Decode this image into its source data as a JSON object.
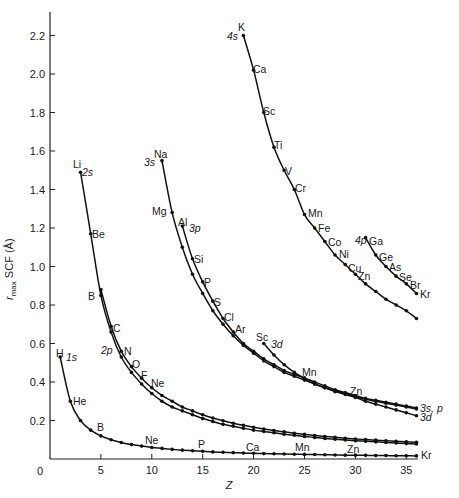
{
  "chart_data": {
    "type": "line",
    "title": "",
    "xlabel": "Z",
    "ylabel": "r_max SCF (Å)",
    "xlim": [
      0,
      37
    ],
    "ylim": [
      0,
      2.3
    ],
    "grid": false,
    "legend": "inline labels at curve ends",
    "x_ticks": [
      0,
      5,
      10,
      15,
      20,
      25,
      30,
      35
    ],
    "y_ticks": [
      0.2,
      0.4,
      0.6,
      0.8,
      1.0,
      1.2,
      1.4,
      1.6,
      1.8,
      2.0,
      2.2
    ],
    "y_tick_labels": [
      "0.2",
      "0.4",
      "0.6",
      "0.8",
      "1.0",
      "1.2",
      "1.4",
      "1.6",
      "1.8",
      "2.0",
      "2.2"
    ],
    "x_tick_labels": [
      "0",
      "5",
      "10",
      "15",
      "20",
      "25",
      "30",
      "35"
    ],
    "series": [
      {
        "name": "1s",
        "label_pos": "start",
        "x": [
          1,
          2,
          3,
          4,
          5,
          6,
          7,
          8,
          9,
          10,
          11,
          12,
          13,
          14,
          15,
          16,
          17,
          18,
          19,
          20,
          21,
          22,
          23,
          24,
          25,
          26,
          27,
          28,
          29,
          30,
          31,
          32,
          33,
          34,
          35,
          36
        ],
        "values": [
          0.53,
          0.3,
          0.2,
          0.15,
          0.12,
          0.1,
          0.086,
          0.075,
          0.067,
          0.06,
          0.055,
          0.05,
          0.046,
          0.043,
          0.04,
          0.037,
          0.035,
          0.033,
          0.031,
          0.03,
          0.028,
          0.027,
          0.026,
          0.025,
          0.024,
          0.023,
          0.022,
          0.021,
          0.02,
          0.02,
          0.019,
          0.018,
          0.018,
          0.017,
          0.017,
          0.016
        ]
      },
      {
        "name": "2s",
        "label_pos": "start",
        "x": [
          3,
          4,
          5,
          6,
          7,
          8,
          9,
          10,
          11,
          12,
          13,
          14,
          15,
          16,
          17,
          18,
          19,
          20,
          21,
          22,
          23,
          24,
          25,
          26,
          27,
          28,
          29,
          30,
          31,
          32,
          33,
          34,
          35,
          36
        ],
        "values": [
          1.49,
          1.17,
          0.85,
          0.66,
          0.53,
          0.45,
          0.39,
          0.34,
          0.3,
          0.27,
          0.25,
          0.23,
          0.21,
          0.195,
          0.18,
          0.17,
          0.16,
          0.15,
          0.143,
          0.136,
          0.129,
          0.123,
          0.117,
          0.112,
          0.107,
          0.103,
          0.099,
          0.095,
          0.092,
          0.089,
          0.086,
          0.083,
          0.08,
          0.078
        ]
      },
      {
        "name": "2p",
        "label_pos": "mid",
        "x": [
          5,
          6,
          7,
          8,
          9,
          10,
          11,
          12,
          13,
          14,
          15,
          16,
          17,
          18,
          19,
          20,
          21,
          22,
          23,
          24,
          25,
          26,
          27,
          28,
          29,
          30,
          31,
          32,
          33,
          34,
          35,
          36
        ],
        "values": [
          0.88,
          0.69,
          0.56,
          0.48,
          0.42,
          0.37,
          0.33,
          0.3,
          0.27,
          0.25,
          0.23,
          0.213,
          0.199,
          0.186,
          0.175,
          0.165,
          0.156,
          0.148,
          0.141,
          0.134,
          0.128,
          0.122,
          0.117,
          0.113,
          0.108,
          0.104,
          0.101,
          0.098,
          0.095,
          0.092,
          0.089,
          0.087
        ]
      },
      {
        "name": "3s",
        "label_pos": "start",
        "x": [
          11,
          12,
          13,
          14,
          15,
          16,
          17,
          18,
          19,
          20,
          21,
          22,
          23,
          24,
          25,
          26,
          27,
          28,
          29,
          30,
          31,
          32,
          33,
          34,
          35,
          36
        ],
        "values": [
          1.55,
          1.28,
          1.1,
          0.96,
          0.86,
          0.77,
          0.7,
          0.64,
          0.59,
          0.55,
          0.51,
          0.48,
          0.45,
          0.43,
          0.41,
          0.39,
          0.37,
          0.355,
          0.34,
          0.325,
          0.31,
          0.3,
          0.29,
          0.28,
          0.27,
          0.26
        ]
      },
      {
        "name": "3p",
        "label_pos": "start",
        "x": [
          13,
          14,
          15,
          16,
          17,
          18,
          19,
          20,
          21,
          22,
          23,
          24,
          25,
          26,
          27,
          28,
          29,
          30,
          31,
          32,
          33,
          34,
          35,
          36
        ],
        "values": [
          1.21,
          1.04,
          0.92,
          0.82,
          0.73,
          0.66,
          0.6,
          0.56,
          0.52,
          0.49,
          0.46,
          0.44,
          0.42,
          0.4,
          0.38,
          0.36,
          0.345,
          0.33,
          0.315,
          0.305,
          0.295,
          0.285,
          0.275,
          0.265
        ]
      },
      {
        "name": "3d",
        "label_pos": "start",
        "x": [
          21,
          22,
          23,
          24,
          25,
          26,
          27,
          28,
          29,
          30,
          31,
          32,
          33,
          34,
          35,
          36
        ],
        "values": [
          0.6,
          0.54,
          0.49,
          0.45,
          0.42,
          0.39,
          0.37,
          0.35,
          0.335,
          0.32,
          0.3,
          0.285,
          0.27,
          0.255,
          0.24,
          0.225
        ]
      },
      {
        "name": "4s",
        "label_pos": "start",
        "x": [
          19,
          20,
          21,
          22,
          23,
          24,
          25,
          26,
          27,
          28,
          29,
          30,
          31,
          32,
          33,
          34,
          35,
          36
        ],
        "values": [
          2.2,
          2.02,
          1.8,
          1.62,
          1.5,
          1.4,
          1.27,
          1.2,
          1.13,
          1.06,
          1.01,
          0.96,
          0.91,
          0.87,
          0.83,
          0.8,
          0.77,
          0.73
        ]
      },
      {
        "name": "4p",
        "label_pos": "start",
        "x": [
          31,
          32,
          33,
          34,
          35,
          36
        ],
        "values": [
          1.15,
          1.06,
          1.0,
          0.95,
          0.91,
          0.86
        ]
      }
    ],
    "element_labels": [
      {
        "text": "H",
        "z": 1,
        "series": "1s"
      },
      {
        "text": "He",
        "z": 2,
        "series": "1s"
      },
      {
        "text": "B",
        "z": 5,
        "series": "1s"
      },
      {
        "text": "Ne",
        "z": 10,
        "series": "1s"
      },
      {
        "text": "P",
        "z": 15,
        "series": "1s"
      },
      {
        "text": "Ca",
        "z": 20,
        "series": "1s"
      },
      {
        "text": "Mn",
        "z": 25,
        "series": "1s"
      },
      {
        "text": "Zn",
        "z": 30,
        "series": "1s"
      },
      {
        "text": "Kr",
        "z": 36,
        "series": "1s"
      },
      {
        "text": "Li",
        "z": 3,
        "series": "2s"
      },
      {
        "text": "Be",
        "z": 4,
        "series": "2s"
      },
      {
        "text": "B",
        "z": 5,
        "series": "2s"
      },
      {
        "text": "C",
        "z": 6,
        "series": "2p"
      },
      {
        "text": "N",
        "z": 7,
        "series": "2p"
      },
      {
        "text": "O",
        "z": 8,
        "series": "2p"
      },
      {
        "text": "F",
        "z": 9,
        "series": "2p"
      },
      {
        "text": "Ne",
        "z": 10,
        "series": "2p"
      },
      {
        "text": "Na",
        "z": 11,
        "series": "3s"
      },
      {
        "text": "Mg",
        "z": 12,
        "series": "3s"
      },
      {
        "text": "Al",
        "z": 13,
        "series": "3p"
      },
      {
        "text": "Si",
        "z": 14,
        "series": "3p"
      },
      {
        "text": "P",
        "z": 15,
        "series": "3p"
      },
      {
        "text": "S",
        "z": 16,
        "series": "3p"
      },
      {
        "text": "Cl",
        "z": 17,
        "series": "3p"
      },
      {
        "text": "Ar",
        "z": 18,
        "series": "3p"
      },
      {
        "text": "Sc",
        "z": 21,
        "series": "3d"
      },
      {
        "text": "Mn",
        "z": 25,
        "series": "3d"
      },
      {
        "text": "Zn",
        "z": 30,
        "series": "3d"
      },
      {
        "text": "K",
        "z": 19,
        "series": "4s"
      },
      {
        "text": "Ca",
        "z": 20,
        "series": "4s"
      },
      {
        "text": "Sc",
        "z": 21,
        "series": "4s"
      },
      {
        "text": "Ti",
        "z": 22,
        "series": "4s"
      },
      {
        "text": "V",
        "z": 23,
        "series": "4s"
      },
      {
        "text": "Cr",
        "z": 24,
        "series": "4s"
      },
      {
        "text": "Mn",
        "z": 25,
        "series": "4s"
      },
      {
        "text": "Fe",
        "z": 26,
        "series": "4s"
      },
      {
        "text": "Co",
        "z": 27,
        "series": "4s"
      },
      {
        "text": "Ni",
        "z": 28,
        "series": "4s"
      },
      {
        "text": "Cu",
        "z": 29,
        "series": "4s"
      },
      {
        "text": "Zn",
        "z": 30,
        "series": "4s"
      },
      {
        "text": "Ga",
        "z": 31,
        "series": "4p"
      },
      {
        "text": "Ge",
        "z": 32,
        "series": "4p"
      },
      {
        "text": "As",
        "z": 33,
        "series": "4p"
      },
      {
        "text": "Se",
        "z": 34,
        "series": "4p"
      },
      {
        "text": "Br",
        "z": 35,
        "series": "4p"
      },
      {
        "text": "Kr",
        "z": 36,
        "series": "4p"
      }
    ],
    "orbital_labels": [
      "1s",
      "2s",
      "2p",
      "3s",
      "3p",
      "3d",
      "4s",
      "4p",
      "3s, p",
      "3d"
    ]
  },
  "axes": {
    "x_title": "Z",
    "y_title_main": "r",
    "y_title_sub": "max",
    "y_title_rest": " SCF (Å)",
    "origin_label": "0"
  },
  "labels": {
    "H": "H",
    "1s": "1s",
    "He": "He",
    "B_1s": "B",
    "Ne_1s": "Ne",
    "P_1s": "P",
    "Ca_1s": "Ca",
    "Mn_1s": "Mn",
    "Zn_1s": "Zn",
    "Kr_1s": "Kr",
    "Li": "Li",
    "2s": "2s",
    "Be": "Be",
    "B_2s": "B",
    "C": "C",
    "2p": "2p",
    "N": "N",
    "O": "O",
    "F": "F",
    "Ne_2p": "Ne",
    "Na": "Na",
    "3s": "3s",
    "Mg": "Mg",
    "Al": "Al",
    "3p": "3p",
    "Si": "Si",
    "P_3p": "P",
    "S": "S",
    "Cl": "Cl",
    "Ar": "Ar",
    "Sc_3d": "Sc",
    "3d": "3d",
    "Mn_3d": "Mn",
    "Zn_3d": "Zn",
    "3sp_end": "3s, p",
    "3d_end": "3d",
    "K": "K",
    "4s": "4s",
    "Ca": "Ca",
    "Sc": "Sc",
    "Ti": "Ti",
    "V": "V",
    "Cr": "Cr",
    "Mn": "Mn",
    "Fe": "Fe",
    "Co": "Co",
    "Ni": "Ni",
    "Cu": "Cu",
    "Zn": "Zn",
    "4p": "4p",
    "Ga": "Ga",
    "Ge": "Ge",
    "As": "As",
    "Se": "Se",
    "Br": "Br",
    "Kr": "Kr"
  },
  "colors": {
    "line": "#111111",
    "axis": "#222222",
    "background": "#ffffff"
  }
}
